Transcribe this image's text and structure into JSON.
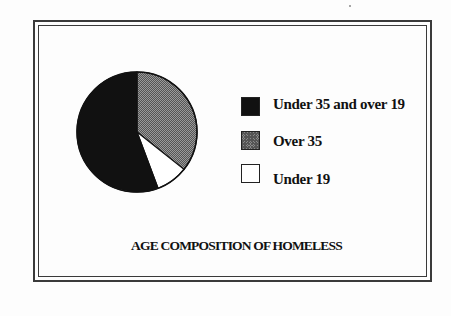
{
  "chart_data": {
    "type": "pie",
    "title": "AGE COMPOSITION OF HOMELESS",
    "categories": [
      "Under 35 and over 19",
      "Over 35",
      "Under 19"
    ],
    "values": [
      55.7,
      35.7,
      8.6
    ],
    "units": "percent (estimated from slice angles)",
    "slice_fills": [
      "#111111",
      "#8a8a8a",
      "#ffffff"
    ],
    "start_angle": "12 o'clock, Over 35 first clockwise",
    "legend_position": "right",
    "grid": false
  },
  "legend": {
    "items": [
      {
        "label": "Under 35 and over 19",
        "swatch": "black"
      },
      {
        "label": "Over 35",
        "swatch": "gray-hatched"
      },
      {
        "label": "Under 19",
        "swatch": "white"
      }
    ]
  },
  "title": "AGE COMPOSITION OF HOMELESS"
}
